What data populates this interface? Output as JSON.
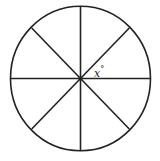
{
  "diagram": {
    "title": "",
    "shape": "circle",
    "center": [
      80.5,
      78.5
    ],
    "radius_x": 70,
    "radius_y": 72,
    "diameters": [
      {
        "name": "vertical",
        "angle_deg": 90
      },
      {
        "name": "horizontal",
        "angle_deg": 0
      },
      {
        "name": "diagonal-ascending",
        "angle_deg": 45
      },
      {
        "name": "diagonal-descending",
        "angle_deg": 135
      }
    ],
    "sectors": 8,
    "angle_label": {
      "variable": "x",
      "unit": "°",
      "text": "x°",
      "position": "between horizontal and ascending diagonal, right of center"
    },
    "stroke_color": "#222222",
    "background_color": "#ffffff",
    "center_dot": true
  }
}
